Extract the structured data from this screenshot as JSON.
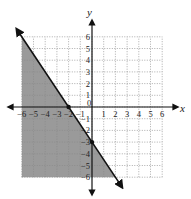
{
  "chart_data": {
    "type": "inequality-graph",
    "title": "",
    "xlabel": "x",
    "ylabel": "y",
    "xlim": [
      -6,
      6
    ],
    "ylim": [
      -6,
      6
    ],
    "grid": true,
    "grid_style": "dotted",
    "x_tick_labels": [
      "-6",
      "-5",
      "-4",
      "-3",
      "-2",
      "-1",
      "0",
      "1",
      "2",
      "3",
      "4",
      "5",
      "6"
    ],
    "y_tick_labels": [
      "6",
      "5",
      "4",
      "3",
      "2",
      "1",
      "-1",
      "-2",
      "-3",
      "-4",
      "-5",
      "-6"
    ],
    "boundary_line": {
      "equation": "y = -3/2 x - 3",
      "slope": -1.5,
      "intercept": -3,
      "style": "solid",
      "points": [
        [
          -2,
          0
        ],
        [
          0,
          -3
        ]
      ]
    },
    "shaded_region": "below-left of line (y <= -3/2 x - 3)",
    "inequality": "y <= -3/2 x - 3",
    "colors": {
      "shade": "#9a9a9a",
      "line": "#111111",
      "grid": "#888888"
    }
  }
}
